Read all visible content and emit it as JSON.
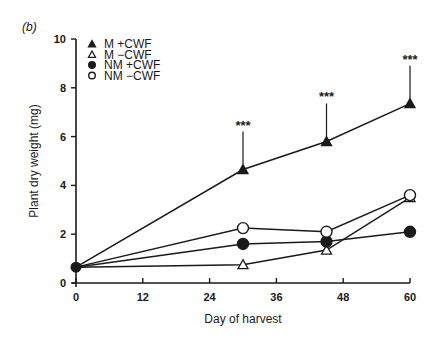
{
  "panel_label": "(b)",
  "chart_data": {
    "type": "line",
    "title": "",
    "xlabel": "Day of harvest",
    "ylabel": "Plant dry weight (mg)",
    "xlim": [
      0,
      60
    ],
    "ylim": [
      0,
      10
    ],
    "xticks": [
      0,
      12,
      24,
      36,
      48,
      60
    ],
    "yticks": [
      0,
      2,
      4,
      6,
      8,
      10
    ],
    "grid": false,
    "legend_position": "top-left",
    "x": [
      0,
      30,
      45,
      60
    ],
    "series": [
      {
        "name": "M +CWF",
        "marker": "filled-triangle",
        "values": [
          0.65,
          4.65,
          5.8,
          7.35
        ]
      },
      {
        "name": "M −CWF",
        "marker": "open-triangle",
        "values": [
          0.65,
          0.75,
          1.35,
          3.5
        ]
      },
      {
        "name": "NM +CWF",
        "marker": "filled-circle",
        "values": [
          0.65,
          1.6,
          1.7,
          2.1
        ]
      },
      {
        "name": "NM −CWF",
        "marker": "open-circle",
        "values": [
          0.65,
          2.25,
          2.1,
          3.6
        ]
      }
    ],
    "annotations": [
      {
        "x": 30,
        "series": "M +CWF",
        "text": "***"
      },
      {
        "x": 45,
        "series": "M +CWF",
        "text": "***"
      },
      {
        "x": 60,
        "series": "M +CWF",
        "text": "***"
      }
    ]
  }
}
